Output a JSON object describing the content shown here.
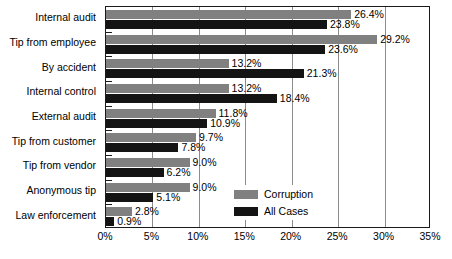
{
  "chart_data": {
    "type": "bar",
    "orientation": "horizontal",
    "title": "",
    "subtitle": "",
    "xlabel": "",
    "ylabel": "",
    "xlim": [
      0,
      35
    ],
    "xtick_labels": [
      "0%",
      "5%",
      "10%",
      "15%",
      "20%",
      "25%",
      "30%",
      "35%"
    ],
    "xtick_values": [
      0,
      5,
      10,
      15,
      20,
      25,
      30,
      35
    ],
    "grid": true,
    "grid_axis": "x",
    "legend_position": "inside-lower-right",
    "categories": [
      "Internal audit",
      "Tip from employee",
      "By accident",
      "Internal control",
      "External audit",
      "Tip from customer",
      "Tip from vendor",
      "Anonymous tip",
      "Law enforcement"
    ],
    "series": [
      {
        "name": "Corruption",
        "color": "#808080",
        "values": [
          26.4,
          29.2,
          13.2,
          13.2,
          11.8,
          9.7,
          9.0,
          9.0,
          2.8
        ],
        "labels": [
          "26.4%",
          "29.2%",
          "13.2%",
          "13.2%",
          "11.8%",
          "9.7%",
          "9.0%",
          "9.0%",
          "2.8%"
        ]
      },
      {
        "name": "All Cases",
        "color": "#141414",
        "values": [
          23.8,
          23.6,
          21.3,
          18.4,
          10.9,
          7.8,
          6.2,
          5.1,
          0.9
        ],
        "labels": [
          "23.8%",
          "23.6%",
          "21.3%",
          "18.4%",
          "10.9%",
          "7.8%",
          "6.2%",
          "5.1%",
          "0.9%"
        ]
      }
    ]
  },
  "legend": {
    "items": [
      {
        "label": "Corruption",
        "color": "#808080"
      },
      {
        "label": "All Cases",
        "color": "#141414"
      }
    ]
  }
}
